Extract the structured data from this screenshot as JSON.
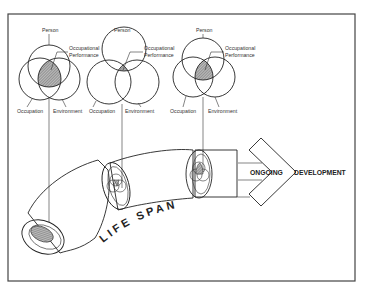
{
  "diagram": {
    "venns": [
      {
        "name": "high-overlap",
        "labels": {
          "person": "Person",
          "performance_line1": "Occupational",
          "performance_line2": "Performance",
          "occupation": "Occupation",
          "environment": "Environment"
        }
      },
      {
        "name": "low-overlap",
        "labels": {
          "person": "Person",
          "performance_line1": "Occupational",
          "performance_line2": "Performance",
          "occupation": "Occupation",
          "environment": "Environment"
        }
      },
      {
        "name": "medium-overlap",
        "labels": {
          "person": "Person",
          "performance_line1": "Occupational",
          "performance_line2": "Performance",
          "occupation": "Occupation",
          "environment": "Environment"
        }
      }
    ],
    "tube_label": "LIFE SPAN",
    "arrow_label_left": "ONGOING",
    "arrow_label_right": "DEVELOPMENT",
    "colors": {
      "ink": "#222222",
      "shade": "#888888",
      "background": "#ffffff"
    }
  }
}
